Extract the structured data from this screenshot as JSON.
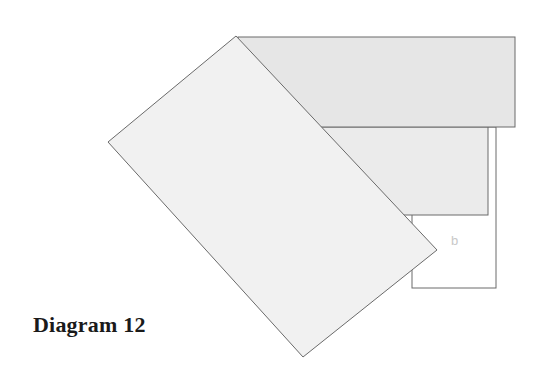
{
  "caption": "Diagram 12",
  "labels": {
    "b": "b"
  },
  "colors": {
    "background": "#ffffff",
    "stroke": "#6a6a6a",
    "top_rect_fill": "#e6e6e6",
    "middle_rect_fill": "#ebebeb",
    "tilted_rect_fill": "#f1f1f1",
    "outline_square_fill": "#ffffff",
    "label_color": "#c8c8c8",
    "caption_color": "#1a1a1a"
  },
  "shapes": {
    "top_rect": {
      "x": 238,
      "y": 37,
      "width": 277,
      "height": 90
    },
    "middle_rect": {
      "x": 300,
      "y": 127,
      "width": 188,
      "height": 88
    },
    "outline_square": {
      "x": 412,
      "y": 127,
      "width": 84,
      "height": 161
    },
    "tilted_rect": {
      "points": [
        [
          236,
          36
        ],
        [
          437,
          250
        ],
        [
          303,
          357
        ],
        [
          108,
          142
        ]
      ]
    }
  }
}
